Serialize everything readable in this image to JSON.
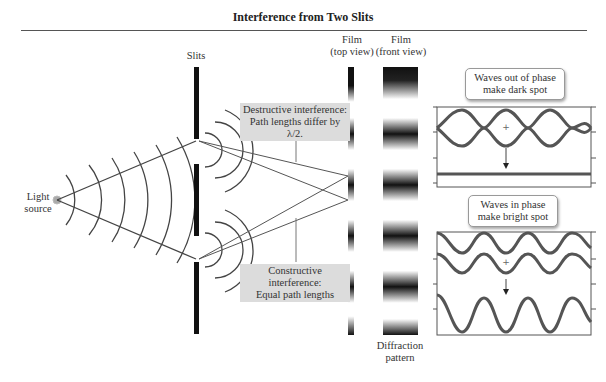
{
  "figure": {
    "title": "Interference from Two Slits"
  },
  "labels": {
    "slits": "Slits",
    "film_top_line1": "Film",
    "film_top_line2": "(top view)",
    "film_front_line1": "Film",
    "film_front_line2": "(front view)",
    "light_source_line1": "Light",
    "light_source_line2": "source",
    "diffraction_line1": "Diffraction",
    "diffraction_line2": "pattern"
  },
  "annotations": {
    "destructive_line1": "Destructive interference:",
    "destructive_line2": "Path lengths differ by λ/2.",
    "constructive_line1": "Constructive interference:",
    "constructive_line2": "Equal path lengths"
  },
  "callouts": {
    "out_of_phase_line1": "Waves out of phase",
    "out_of_phase_line2": "make dark spot",
    "in_phase_line1": "Waves in phase",
    "in_phase_line2": "make bright spot"
  },
  "colors": {
    "wave": "#555555",
    "line": "#444444",
    "slit": "#111111",
    "note_bg": "#dcdcdc",
    "source": "#aaaaaa"
  }
}
